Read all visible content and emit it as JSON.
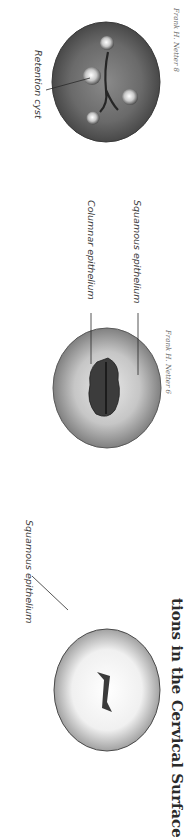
{
  "figure": {
    "title": "tions in the Cervical Surface",
    "panels": [
      {
        "id": "retention-cyst-cervix",
        "labels": [
          "Retention cyst"
        ],
        "signature": "Frank H. Netter 8"
      },
      {
        "id": "ectropion-cervix",
        "labels": [
          "Columnar epithelium",
          "Squamous epithelium"
        ],
        "signature": "Frank H. Netter 6"
      },
      {
        "id": "normal-cervix",
        "labels": [
          "Squamous epithelium"
        ]
      }
    ]
  },
  "colors": {
    "background": "#ffffff",
    "text": "#3a3a3a",
    "tissue_dark": "#4a4a4a",
    "tissue_light": "#f2f2f2"
  }
}
